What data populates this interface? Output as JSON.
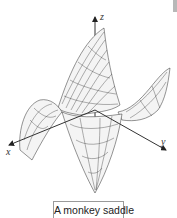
{
  "figure": {
    "caption": "A monkey saddle",
    "surface": "monkey saddle wireframe",
    "axes": {
      "x_label": "x",
      "y_label": "y",
      "z_label": "z"
    },
    "colors": {
      "mesh": "#2b2b2b",
      "axis": "#333333",
      "background": "#ffffff",
      "caption_border": "#9a9a9a"
    }
  }
}
